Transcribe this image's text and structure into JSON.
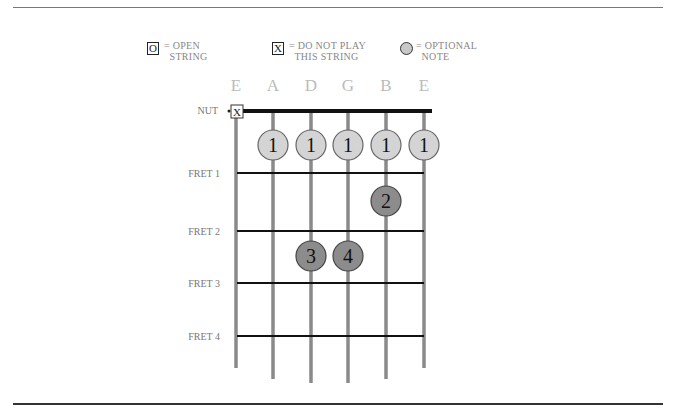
{
  "legend": [
    {
      "symbol": "O",
      "type": "box",
      "text": "= OPEN\n  STRING"
    },
    {
      "symbol": "X",
      "type": "box",
      "text": "= DO NOT PLAY\n  THIS STRING"
    },
    {
      "symbol": "",
      "type": "circle",
      "text": "= OPTIONAL\n  NOTE"
    }
  ],
  "strings": [
    "E",
    "A",
    "D",
    "G",
    "B",
    "E"
  ],
  "nut_label": "NUT",
  "muted_marker": "X",
  "fret_labels": [
    "FRET 1",
    "FRET 2",
    "FRET 3",
    "FRET 4"
  ],
  "notes": [
    {
      "string": 2,
      "position": "open-row",
      "finger": "1",
      "optional": true
    },
    {
      "string": 3,
      "position": "open-row",
      "finger": "1",
      "optional": true
    },
    {
      "string": 4,
      "position": "open-row",
      "finger": "1",
      "optional": true
    },
    {
      "string": 5,
      "position": "open-row",
      "finger": "1",
      "optional": true
    },
    {
      "string": 6,
      "position": "open-row",
      "finger": "1",
      "optional": true
    },
    {
      "string": 5,
      "fret": 2,
      "finger": "2",
      "optional": false
    },
    {
      "string": 3,
      "fret": 3,
      "finger": "3",
      "optional": false
    },
    {
      "string": 4,
      "fret": 3,
      "finger": "4",
      "optional": false
    }
  ],
  "colors": {
    "optional_fill": "#d4d4d4",
    "fingered_fill": "#8c8c8c",
    "string": "#8a8a8a",
    "fret": "#111111"
  }
}
